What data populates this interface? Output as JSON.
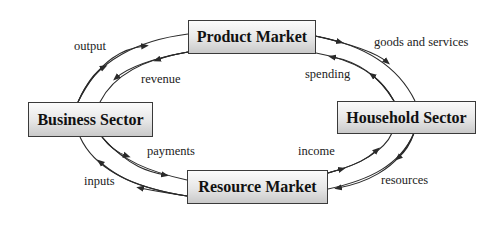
{
  "boxes": {
    "product_market": "Product Market",
    "business_sector": "Business Sector",
    "household_sector": "Household Sector",
    "resource_market": "Resource Market"
  },
  "flows": {
    "output": "output",
    "revenue": "revenue",
    "goods_and_services": "goods and services",
    "spending": "spending",
    "payments": "payments",
    "inputs": "inputs",
    "income": "income",
    "resources": "resources"
  },
  "colors": {
    "line": "#2a2a2a",
    "box_border": "#3a3a3a",
    "box_gradient_top": "#fbfbfb",
    "box_gradient_bottom": "#c9c9c9"
  }
}
